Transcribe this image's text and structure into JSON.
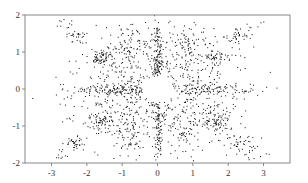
{
  "chart_data": {
    "type": "scatter",
    "title": "",
    "xlabel": "",
    "ylabel": "",
    "xlim": [
      -3.75,
      3.75
    ],
    "ylim": [
      -2,
      2
    ],
    "grid": false,
    "legend": "none",
    "symmetry": "mirror-x-and-y",
    "x_ticks": [
      -3,
      -2,
      -1,
      0,
      1,
      2,
      3
    ],
    "x_tick_labels": [
      "-3",
      "-2",
      "-1",
      "0",
      "1",
      "2",
      "3"
    ],
    "y_ticks": [
      -2,
      -1,
      0,
      1,
      2
    ],
    "y_tick_labels": [
      "-2",
      "-1",
      "0",
      "1",
      "2"
    ],
    "point_color": "#111111",
    "seed": 7,
    "clusters": [
      {
        "name": "diffuse-cloud",
        "cx": 0.9,
        "cy": 0.7,
        "sx": 0.75,
        "sy": 0.55,
        "n": 900
      },
      {
        "name": "vertical-column",
        "cx": 0.03,
        "cy": 0.9,
        "sx": 0.05,
        "sy": 0.55,
        "n": 220
      },
      {
        "name": "horizontal-band",
        "cx": 1.3,
        "cy": 0.03,
        "sx": 0.75,
        "sy": 0.07,
        "n": 260
      },
      {
        "name": "inner-arc",
        "cx": 1.6,
        "cy": 0.85,
        "sx": 0.18,
        "sy": 0.12,
        "n": 200
      },
      {
        "name": "outer-arc",
        "cx": 2.3,
        "cy": 1.45,
        "sx": 0.18,
        "sy": 0.1,
        "n": 130
      },
      {
        "name": "mid-cluster",
        "cx": 0.8,
        "cy": 1.25,
        "sx": 0.15,
        "sy": 0.2,
        "n": 120
      },
      {
        "name": "edge-spray",
        "cx": 2.7,
        "cy": 1.75,
        "sx": 0.15,
        "sy": 0.08,
        "n": 40
      }
    ],
    "center_hole": {
      "cx": 0,
      "cy": 0,
      "rx": 0.45,
      "ry": 0.35
    }
  }
}
